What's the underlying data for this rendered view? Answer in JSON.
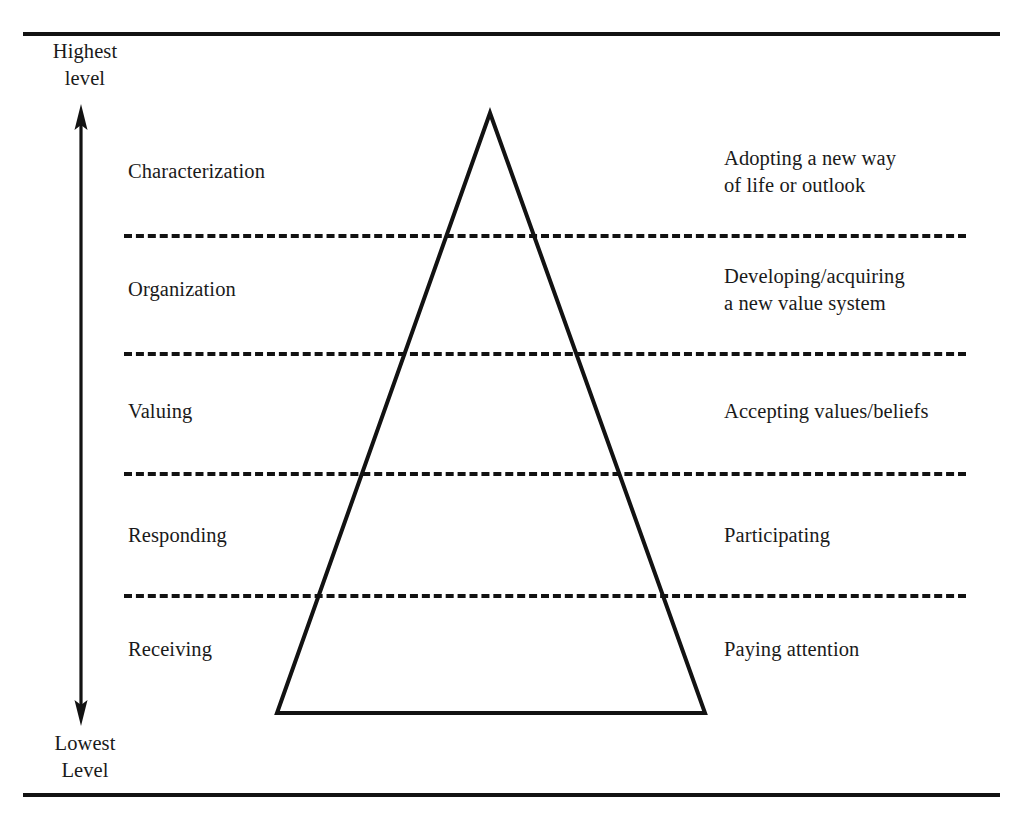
{
  "diagram": {
    "type": "affective-domain-taxonomy-pyramid",
    "axis": {
      "top_caption_line1": "Highest",
      "top_caption_line2": "level",
      "bottom_caption_line1": "Lowest",
      "bottom_caption_line2": "Level",
      "arrow_icon": "double-headed-vertical-arrow-icon"
    },
    "levels": [
      {
        "order": 5,
        "name": "Characterization",
        "description": "Adopting a new way\nof life or outlook",
        "left_top": 158,
        "right_top": 145
      },
      {
        "order": 4,
        "name": "Organization",
        "description": "Developing/acquiring\na new value system",
        "left_top": 276,
        "right_top": 263
      },
      {
        "order": 3,
        "name": "Valuing",
        "description": "Accepting values/beliefs",
        "left_top": 398,
        "right_top": 398
      },
      {
        "order": 2,
        "name": "Responding",
        "description": "Participating",
        "left_top": 522,
        "right_top": 522
      },
      {
        "order": 1,
        "name": "Receiving",
        "description": "Paying attention",
        "left_top": 636,
        "right_top": 636
      }
    ],
    "separator_positions": [
      234,
      352,
      472,
      594
    ],
    "colors": {
      "ink": "#121212",
      "background": "#ffffff"
    }
  }
}
